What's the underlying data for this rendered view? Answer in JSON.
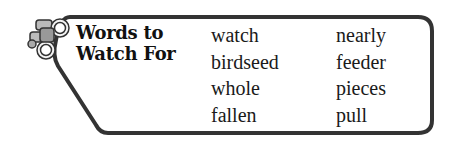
{
  "header": {
    "title_line1": "Words to",
    "title_line2": "Watch For",
    "icon": "binoculars-icon"
  },
  "words": {
    "column1": [
      "watch",
      "birdseed",
      "whole",
      "fallen"
    ],
    "column2": [
      "nearly",
      "feeder",
      "pieces",
      "pull"
    ]
  },
  "colors": {
    "border": "#333333",
    "text": "#1a1a1a",
    "background": "#ffffff"
  }
}
